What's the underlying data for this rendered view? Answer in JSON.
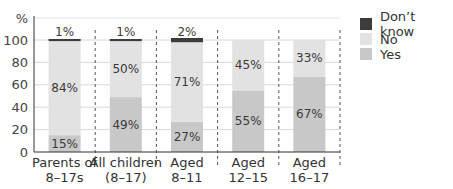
{
  "chart_data": {
    "type": "bar",
    "stacked": true,
    "title": "",
    "xlabel": "",
    "ylabel": "%",
    "ylim": [
      0,
      100
    ],
    "yticks": [
      0,
      20,
      40,
      60,
      80,
      100
    ],
    "grid": true,
    "legend_position": "right",
    "categories": [
      "Parents of 8–17s",
      "All children (8–17)",
      "Aged 8–11",
      "Aged 12–15",
      "Aged 16–17"
    ],
    "category_lines": [
      [
        "Parents of",
        "8–17s"
      ],
      [
        "All children",
        "(8–17)"
      ],
      [
        "Aged",
        "8–11"
      ],
      [
        "Aged",
        "12–15"
      ],
      [
        "Aged",
        "16–17"
      ]
    ],
    "series": [
      {
        "name": "Yes",
        "color": "#c8c8c8",
        "values": [
          15,
          49,
          27,
          55,
          67
        ],
        "labels": [
          "15%",
          "49%",
          "27%",
          "55%",
          "67%"
        ]
      },
      {
        "name": "No",
        "color": "#e2e2e2",
        "values": [
          84,
          50,
          71,
          45,
          33
        ],
        "labels": [
          "84%",
          "50%",
          "71%",
          "45%",
          "33%"
        ]
      },
      {
        "name": "Don't know",
        "color": "#3c3c3c",
        "values": [
          1,
          1,
          2,
          0,
          0
        ],
        "labels": [
          "1%",
          "1%",
          "2%",
          "",
          ""
        ]
      }
    ]
  },
  "legend": [
    {
      "label": "Don’t know",
      "color": "#3c3c3c"
    },
    {
      "label": "No",
      "color": "#e2e2e2"
    },
    {
      "label": "Yes",
      "color": "#c8c8c8"
    }
  ]
}
